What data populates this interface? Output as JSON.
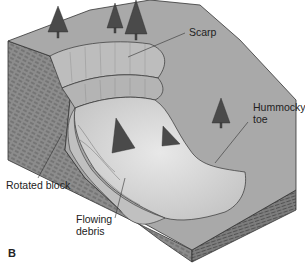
{
  "figure": {
    "panel_letter": "B",
    "labels": {
      "scarp": "Scarp",
      "hummocky_toe_line1": "Hummocky",
      "hummocky_toe_line2": "toe",
      "rotated_block": "Rotated block",
      "flowing_debris_line1": "Flowing",
      "flowing_debris_line2": "debris"
    },
    "colors": {
      "ground_surface": "#a9a9a9",
      "slump_surface": "#d4d4d4",
      "block_side": "#8c8c8c",
      "strata_lines": "#444444",
      "scarp_face": "#bdbdbd",
      "tree": "#4a4a4a",
      "leader_line": "#333333"
    }
  }
}
